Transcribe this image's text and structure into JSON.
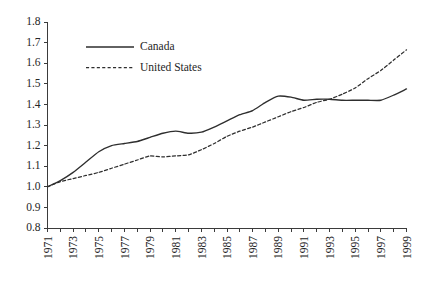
{
  "chart_data": {
    "type": "line",
    "title": "",
    "subtitle": "",
    "xlabel": "",
    "ylabel": "",
    "xlim": [
      1971,
      1999
    ],
    "ylim": [
      0.8,
      1.8
    ],
    "ytick_step": 0.1,
    "grid": false,
    "legend_position": "top-left",
    "x": [
      1971,
      1972,
      1973,
      1974,
      1975,
      1976,
      1977,
      1978,
      1979,
      1980,
      1981,
      1982,
      1983,
      1984,
      1985,
      1986,
      1987,
      1988,
      1989,
      1990,
      1991,
      1992,
      1993,
      1994,
      1995,
      1996,
      1997,
      1998,
      1999
    ],
    "ytick_labels": [
      "0.8",
      "0.9",
      "1.0",
      "1.1",
      "1.2",
      "1.3",
      "1.4",
      "1.5",
      "1.6",
      "1.7",
      "1.8"
    ],
    "ytick_values": [
      0.8,
      0.9,
      1.0,
      1.1,
      1.2,
      1.3,
      1.4,
      1.5,
      1.6,
      1.7,
      1.8
    ],
    "xtick_labels": [
      "1971",
      "1973",
      "1975",
      "1977",
      "1979",
      "1981",
      "1983",
      "1985",
      "1987",
      "1989",
      "1991",
      "1993",
      "1995",
      "1997",
      "1999"
    ],
    "xtick_values": [
      1971,
      1973,
      1975,
      1977,
      1979,
      1981,
      1983,
      1985,
      1987,
      1989,
      1991,
      1993,
      1995,
      1997,
      1999
    ],
    "xminor_values": [
      1972,
      1974,
      1976,
      1978,
      1980,
      1982,
      1984,
      1986,
      1988,
      1990,
      1992,
      1994,
      1996,
      1998
    ],
    "series": [
      {
        "name": "Canada",
        "style": "solid",
        "color": "#2e2e2e",
        "values": [
          1.0,
          1.03,
          1.07,
          1.12,
          1.17,
          1.2,
          1.21,
          1.22,
          1.24,
          1.26,
          1.27,
          1.26,
          1.265,
          1.29,
          1.32,
          1.35,
          1.37,
          1.41,
          1.44,
          1.435,
          1.42,
          1.425,
          1.425,
          1.42,
          1.42,
          1.42,
          1.42,
          1.445,
          1.475
        ]
      },
      {
        "name": "United States",
        "style": "dashed",
        "color": "#2e2e2e",
        "values": [
          1.0,
          1.025,
          1.04,
          1.055,
          1.07,
          1.09,
          1.11,
          1.13,
          1.15,
          1.145,
          1.15,
          1.155,
          1.18,
          1.21,
          1.245,
          1.27,
          1.29,
          1.315,
          1.34,
          1.365,
          1.385,
          1.41,
          1.425,
          1.45,
          1.48,
          1.525,
          1.565,
          1.615,
          1.665
        ]
      }
    ]
  },
  "legend": {
    "entries": [
      {
        "label": "Canada",
        "style": "solid"
      },
      {
        "label": "United States",
        "style": "dashed"
      }
    ]
  }
}
